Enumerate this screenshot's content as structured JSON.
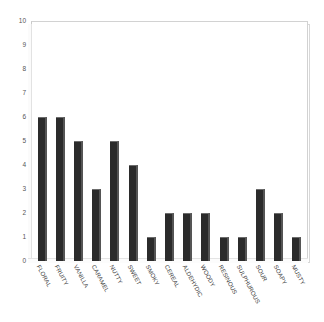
{
  "chart_data": {
    "type": "bar",
    "title": "",
    "xlabel": "",
    "ylabel": "",
    "ylim": [
      0,
      10
    ],
    "yticks": [
      0,
      1,
      2,
      3,
      4,
      5,
      6,
      7,
      8,
      9,
      10
    ],
    "grid": false,
    "legend": false,
    "categories": [
      "FLORAL",
      "FRUITY",
      "VANILLA",
      "CARAMEL",
      "NUTTY",
      "SWEET",
      "SMOKY",
      "CEREAL",
      "ALDEHYDIC",
      "WOODY",
      "RESINOUS",
      "SULPHUROUS",
      "SOUR",
      "SOAPY",
      "MUSTY"
    ],
    "values": [
      6,
      6,
      5,
      3,
      5,
      4,
      1,
      2,
      2,
      2,
      1,
      1,
      3,
      2,
      1
    ],
    "bar_color": "#2b2b2b",
    "frame_color": "#c9c9c9",
    "background_color": "#ffffff"
  }
}
